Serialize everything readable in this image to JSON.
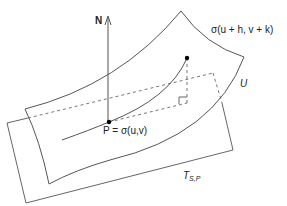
{
  "diagram": {
    "labels": {
      "normal": "N",
      "point": "P = σ(u,v)",
      "nearby_point": "σ(u + h, v + k)",
      "surface": "U",
      "tangent_plane_main": "T",
      "tangent_plane_sub": "S,P"
    },
    "colors": {
      "stroke": "#555555",
      "point": "#000000",
      "text": "#222222"
    }
  }
}
